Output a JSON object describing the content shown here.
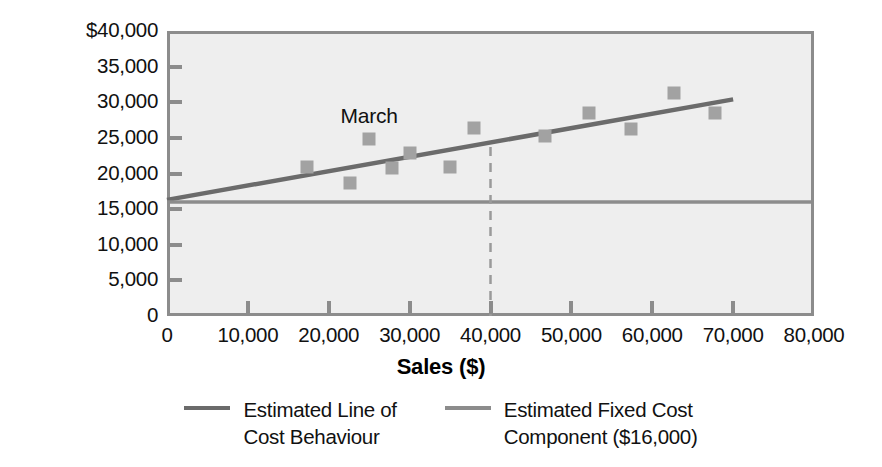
{
  "chart_data": {
    "type": "scatter",
    "title": "",
    "xlabel": "Sales ($)",
    "ylabel": "Cost ($)",
    "xlim": [
      0,
      80000
    ],
    "ylim": [
      0,
      40000
    ],
    "grid": false,
    "plot_background": "#eeeeee",
    "marker_color": "#a2a2a2",
    "series": [
      {
        "name": "Monthly cost observations",
        "type": "scatter",
        "points": [
          {
            "x": 17300,
            "y": 20900,
            "label": ""
          },
          {
            "x": 22600,
            "y": 18600,
            "label": ""
          },
          {
            "x": 25000,
            "y": 24900,
            "label": "March"
          },
          {
            "x": 27800,
            "y": 20800,
            "label": ""
          },
          {
            "x": 30000,
            "y": 22900,
            "label": ""
          },
          {
            "x": 35000,
            "y": 20900,
            "label": ""
          },
          {
            "x": 38000,
            "y": 26400,
            "label": ""
          },
          {
            "x": 46800,
            "y": 25300,
            "label": ""
          },
          {
            "x": 52200,
            "y": 28500,
            "label": ""
          },
          {
            "x": 57400,
            "y": 26200,
            "label": ""
          },
          {
            "x": 62700,
            "y": 31300,
            "label": ""
          },
          {
            "x": 67700,
            "y": 28500,
            "label": ""
          }
        ]
      },
      {
        "name": "Estimated Line of Cost Behaviour",
        "type": "line",
        "color": "#6b6b6b",
        "x": [
          0,
          70000
        ],
        "y": [
          16300,
          30400
        ]
      },
      {
        "name": "Estimated Fixed Cost Component ($16,000)",
        "type": "line",
        "color": "#8c8c8c",
        "x": [
          0,
          80000
        ],
        "y": [
          16000,
          16000
        ]
      },
      {
        "name": "Reference drop line at Sales = 40,000",
        "type": "dashed-vertical",
        "color": "#9a9a9a",
        "x": 40000,
        "y_from": 0,
        "y_to": 24300
      }
    ],
    "annotations": [
      {
        "text": "March",
        "x": 25000,
        "y": 28100
      }
    ],
    "yticks": [
      {
        "value": 0,
        "label": "0"
      },
      {
        "value": 5000,
        "label": "5,000"
      },
      {
        "value": 10000,
        "label": "10,000"
      },
      {
        "value": 15000,
        "label": "15,000"
      },
      {
        "value": 20000,
        "label": "20,000"
      },
      {
        "value": 25000,
        "label": "25,000"
      },
      {
        "value": 30000,
        "label": "30,000"
      },
      {
        "value": 35000,
        "label": "35,000"
      },
      {
        "value": 40000,
        "label": "$40,000"
      }
    ],
    "xticks": [
      {
        "value": 0,
        "label": "0"
      },
      {
        "value": 10000,
        "label": "10,000"
      },
      {
        "value": 20000,
        "label": "20,000"
      },
      {
        "value": 30000,
        "label": "30,000"
      },
      {
        "value": 40000,
        "label": "40,000"
      },
      {
        "value": 50000,
        "label": "50,000"
      },
      {
        "value": 60000,
        "label": "60,000"
      },
      {
        "value": 70000,
        "label": "70,000"
      },
      {
        "value": 80000,
        "label": "80,000"
      }
    ],
    "legend": {
      "position": "bottom",
      "entries": [
        {
          "label": "Estimated Line of\nCost Behaviour",
          "color": "#6b6b6b"
        },
        {
          "label": "Estimated Fixed Cost\nComponent ($16,000)",
          "color": "#8c8c8c"
        }
      ]
    }
  }
}
